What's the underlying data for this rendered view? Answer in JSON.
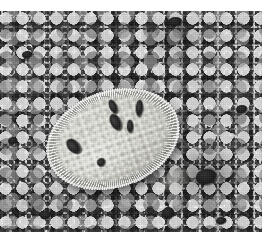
{
  "image": {
    "domain": "Natural-Image",
    "kind": "photograph",
    "title": "Sea slug on sandy seabed",
    "description": "Close-up colour photograph of a pale, oval-bodied sea slug (dorid nudibranch) resting on coarse grey sand. The animal's mantle is cream-white, densely covered in small rounded tubercles, with a frilly radiating margin and several dark brown-black pigment blotches on its back.",
    "palette": {
      "paper_white": "#ffffff",
      "sand_light": "#9a9a9a",
      "sand_mid": "#6d6d6d",
      "sand_dark": "#2b2b2b",
      "slug_highlight": "#f2f2ee",
      "slug_body": "#dedeD6",
      "slug_shadow": "#b4b4ac",
      "spot_black": "#141414"
    },
    "frame": {
      "width": 274,
      "height": 244,
      "photo_left": 0,
      "photo_top": 11,
      "photo_width": 262,
      "photo_height": 221,
      "margin_note": "white page margin along the top, right and bottom edges"
    },
    "subject": {
      "label": "sea-slug",
      "center_x": 113,
      "center_y": 128,
      "width": 136,
      "height": 96,
      "rotation_deg": -19,
      "texture": "tuberculate mantle with radiating frilled margin"
    },
    "markings": [
      {
        "name": "mantle-spot-left",
        "x": 23,
        "y": 33,
        "w": 12,
        "h": 19,
        "rot": -28
      },
      {
        "name": "mantle-spot-upper-1",
        "x": 75,
        "y": 10,
        "w": 8,
        "h": 16,
        "rot": -8
      },
      {
        "name": "mantle-spot-upper-2",
        "x": 71,
        "y": 24,
        "w": 11,
        "h": 19,
        "rot": -12
      },
      {
        "name": "mantle-spot-upper-3",
        "x": 85,
        "y": 35,
        "w": 7,
        "h": 14,
        "rot": 14
      },
      {
        "name": "mantle-spot-right",
        "x": 99,
        "y": 19,
        "w": 8,
        "h": 18,
        "rot": 20
      },
      {
        "name": "mantle-spot-lower-round",
        "x": 45,
        "y": 62,
        "w": 9,
        "h": 9,
        "rot": 0
      }
    ],
    "background_stones": [
      {
        "name": "dark-stone-top",
        "x": 168,
        "y": 6,
        "w": 15,
        "h": 10
      },
      {
        "name": "dark-stone-right",
        "x": 196,
        "y": 158,
        "w": 22,
        "h": 17
      },
      {
        "name": "dark-stone-lower-centre",
        "x": 162,
        "y": 196,
        "w": 13,
        "h": 13
      },
      {
        "name": "dark-stone-upper-left",
        "x": 22,
        "y": 40,
        "w": 11,
        "h": 8
      },
      {
        "name": "dark-stone-mid-left",
        "x": 8,
        "y": 126,
        "w": 10,
        "h": 8
      },
      {
        "name": "dark-stone-bottom-left",
        "x": 40,
        "y": 200,
        "w": 12,
        "h": 9
      },
      {
        "name": "dark-stone-far-right",
        "x": 236,
        "y": 94,
        "w": 12,
        "h": 9
      },
      {
        "name": "dark-stone-bottom-right",
        "x": 216,
        "y": 206,
        "w": 11,
        "h": 8
      },
      {
        "name": "light-stone-right",
        "x": 228,
        "y": 122,
        "w": 7,
        "h": 6
      }
    ]
  }
}
